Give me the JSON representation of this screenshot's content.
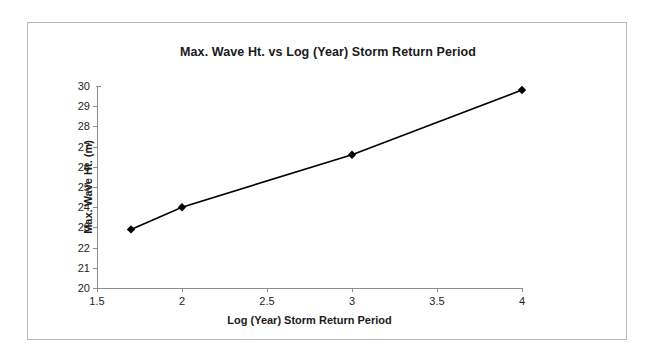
{
  "chart_data": {
    "type": "line",
    "title": "Max. Wave Ht. vs Log (Year) Storm Return Period",
    "xlabel": "Log (Year) Storm Return Period",
    "ylabel": "Max. Wave Ht. (m)",
    "xlim": [
      1.5,
      4
    ],
    "ylim": [
      20,
      30
    ],
    "xticks": [
      1.5,
      2,
      2.5,
      3,
      3.5,
      4
    ],
    "xtick_labels": [
      "1.5",
      "2",
      "2.5",
      "3",
      "3.5",
      "4"
    ],
    "yticks": [
      20,
      21,
      22,
      23,
      24,
      25,
      26,
      27,
      28,
      29,
      30
    ],
    "ytick_labels": [
      "20",
      "21",
      "22",
      "23",
      "24",
      "25",
      "26",
      "27",
      "28",
      "29",
      "30"
    ],
    "grid": false,
    "legend": false,
    "marker": "diamond",
    "line_color": "#000000",
    "marker_color": "#000000",
    "series": [
      {
        "name": "Max. Wave Ht.",
        "x": [
          1.7,
          2.0,
          3.0,
          4.0
        ],
        "values": [
          22.9,
          24.0,
          26.6,
          29.8
        ]
      }
    ]
  }
}
